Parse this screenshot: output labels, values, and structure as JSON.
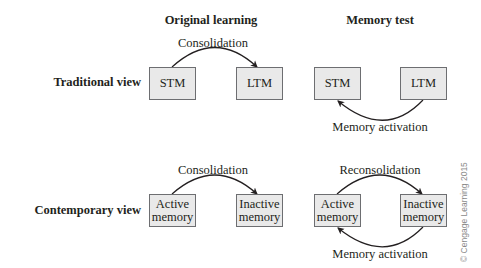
{
  "columns": {
    "original_learning": "Original learning",
    "memory_test": "Memory test"
  },
  "rows": {
    "traditional": {
      "label": "Traditional view",
      "original_learning": {
        "from_box": "STM",
        "to_box": "LTM",
        "arrow_label": "Consolidation"
      },
      "memory_test": {
        "left_box": "STM",
        "right_box": "LTM",
        "bottom_arrow_label": "Memory activation"
      }
    },
    "contemporary": {
      "label": "Contemporary view",
      "original_learning": {
        "from_box_line1": "Active",
        "from_box_line2": "memory",
        "to_box_line1": "Inactive",
        "to_box_line2": "memory",
        "arrow_label": "Consolidation"
      },
      "memory_test": {
        "left_box_line1": "Active",
        "left_box_line2": "memory",
        "right_box_line1": "Inactive",
        "right_box_line2": "memory",
        "top_arrow_label": "Reconsolidation",
        "bottom_arrow_label": "Memory activation"
      }
    }
  },
  "copyright": "© Cengage Learning 2015",
  "colors": {
    "box_fill": "#e9e9e9",
    "box_border": "#6d6e71",
    "text": "#231f20",
    "arrow": "#231f20"
  }
}
